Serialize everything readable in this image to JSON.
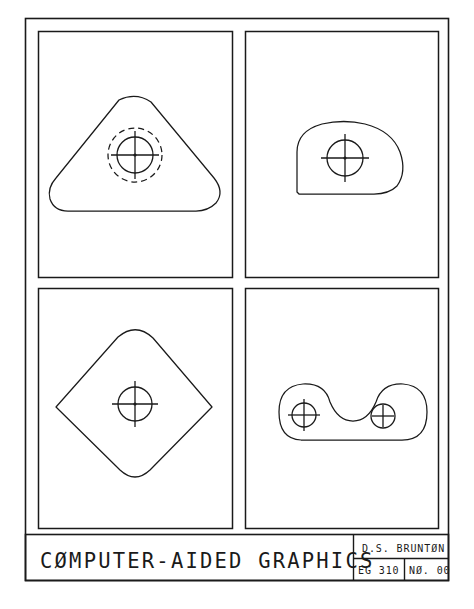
{
  "sheet": {
    "title": "CØMPUTER-AIDED GRAPHICS",
    "border_color": "#1a1a1a",
    "line_color": "#1a1a1a",
    "background": "#ffffff"
  },
  "title_block": {
    "author": "D.S. BRUNTØN",
    "course": "EG 310",
    "number": "NØ. 00"
  },
  "panels": [
    {
      "id": "panel-1",
      "name": "rounded-triangle-plate",
      "shape": "rounded triangle",
      "features": [
        "solid-circle",
        "dashed-hidden-circle",
        "center-mark"
      ]
    },
    {
      "id": "panel-2",
      "name": "d-shaped-plate",
      "shape": "dome with flat base",
      "features": [
        "solid-circle",
        "center-mark"
      ]
    },
    {
      "id": "panel-3",
      "name": "kite-plate",
      "shape": "kite with rounded top and bottom",
      "features": [
        "solid-circle",
        "center-mark"
      ]
    },
    {
      "id": "panel-4",
      "name": "dogbone-link-plate",
      "shape": "two-lobe link with concave top",
      "features": [
        "solid-circle-left",
        "center-mark-left",
        "solid-circle-right",
        "plus-mark-right"
      ]
    }
  ]
}
